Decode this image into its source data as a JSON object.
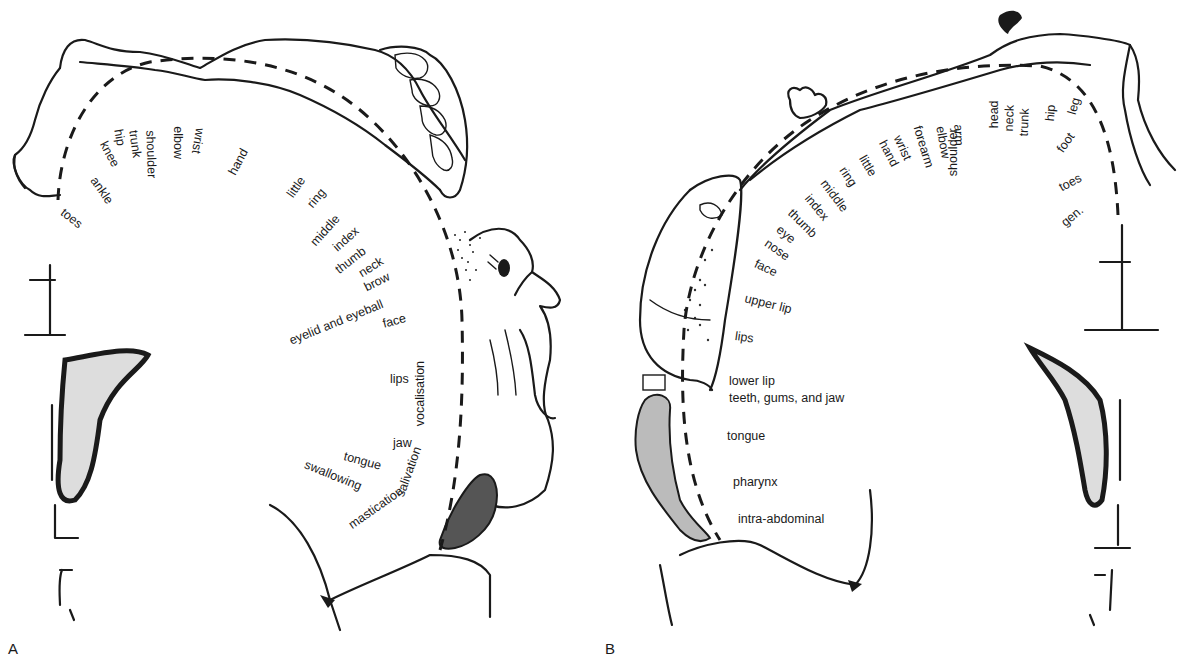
{
  "figure": {
    "panel_a_letter": "A",
    "panel_b_letter": "B"
  },
  "panel_a": {
    "title": "Motor homunculus",
    "labels": [
      {
        "text": "toes",
        "x": 62,
        "y": 205,
        "rot": 38
      },
      {
        "text": "ankle",
        "x": 93,
        "y": 172,
        "rot": 55
      },
      {
        "text": "knee",
        "x": 103,
        "y": 136,
        "rot": 62
      },
      {
        "text": "hip",
        "x": 118,
        "y": 123,
        "rot": 80
      },
      {
        "text": "trunk",
        "x": 133,
        "y": 124,
        "rot": 82
      },
      {
        "text": "shoulder",
        "x": 150,
        "y": 124,
        "rot": 88
      },
      {
        "text": "elbow",
        "x": 178,
        "y": 120,
        "rot": 90
      },
      {
        "text": "wrist",
        "x": 200,
        "y": 122,
        "rot": 100
      },
      {
        "text": "hand",
        "x": 232,
        "y": 168,
        "rot": -62
      },
      {
        "text": "little",
        "x": 290,
        "y": 190,
        "rot": -55
      },
      {
        "text": "ring",
        "x": 310,
        "y": 200,
        "rot": -50
      },
      {
        "text": "middle",
        "x": 313,
        "y": 238,
        "rot": -48
      },
      {
        "text": "index",
        "x": 335,
        "y": 243,
        "rot": -42
      },
      {
        "text": "thumb",
        "x": 337,
        "y": 265,
        "rot": -38
      },
      {
        "text": "neck",
        "x": 360,
        "y": 268,
        "rot": -32
      },
      {
        "text": "brow",
        "x": 365,
        "y": 282,
        "rot": -27
      },
      {
        "text": "eyelid and eyeball",
        "x": 290,
        "y": 335,
        "rot": -22
      },
      {
        "text": "face",
        "x": 383,
        "y": 318,
        "rot": -15
      },
      {
        "text": "lips",
        "x": 390,
        "y": 373,
        "rot": 0
      },
      {
        "text": "jaw",
        "x": 393,
        "y": 437,
        "rot": 0
      },
      {
        "text": "tongue",
        "x": 344,
        "y": 450,
        "rot": 15
      },
      {
        "text": "swallowing",
        "x": 305,
        "y": 458,
        "rot": 22
      }
    ],
    "functions": [
      {
        "text": "vocalisation",
        "x": 420,
        "y": 420,
        "rot": -90
      },
      {
        "text": "salivation",
        "x": 400,
        "y": 490,
        "rot": -70
      },
      {
        "text": "mastication",
        "x": 350,
        "y": 520,
        "rot": -35
      }
    ]
  },
  "panel_b": {
    "title": "Sensory homunculus",
    "labels": [
      {
        "text": "gen.",
        "x": 1063,
        "y": 218,
        "rot": -40
      },
      {
        "text": "toes",
        "x": 1060,
        "y": 182,
        "rot": -28
      },
      {
        "text": "foot",
        "x": 1060,
        "y": 145,
        "rot": -55
      },
      {
        "text": "leg",
        "x": 1072,
        "y": 108,
        "rot": -75
      },
      {
        "text": "hip",
        "x": 1050,
        "y": 115,
        "rot": -85
      },
      {
        "text": "trunk",
        "x": 1024,
        "y": 130,
        "rot": -88
      },
      {
        "text": "neck",
        "x": 1009,
        "y": 125,
        "rot": -88
      },
      {
        "text": "head",
        "x": 994,
        "y": 122,
        "rot": -90
      },
      {
        "text": "shoulder",
        "x": 953,
        "y": 170,
        "rot": -90
      },
      {
        "text": "arm",
        "x": 958,
        "y": 118,
        "rot": 88
      },
      {
        "text": "elbow",
        "x": 940,
        "y": 120,
        "rot": 80
      },
      {
        "text": "forearm",
        "x": 917,
        "y": 120,
        "rot": 73
      },
      {
        "text": "wrist",
        "x": 897,
        "y": 130,
        "rot": 65
      },
      {
        "text": "hand",
        "x": 882,
        "y": 135,
        "rot": 62
      },
      {
        "text": "little",
        "x": 862,
        "y": 150,
        "rot": 60
      },
      {
        "text": "ring",
        "x": 842,
        "y": 162,
        "rot": 56
      },
      {
        "text": "middle",
        "x": 823,
        "y": 175,
        "rot": 53
      },
      {
        "text": "index",
        "x": 807,
        "y": 190,
        "rot": 50
      },
      {
        "text": "thumb",
        "x": 790,
        "y": 205,
        "rot": 45
      },
      {
        "text": "eye",
        "x": 778,
        "y": 222,
        "rot": 40
      },
      {
        "text": "nose",
        "x": 766,
        "y": 236,
        "rot": 35
      },
      {
        "text": "face",
        "x": 755,
        "y": 257,
        "rot": 25
      },
      {
        "text": "upper lip",
        "x": 745,
        "y": 292,
        "rot": 14
      },
      {
        "text": "lips",
        "x": 735,
        "y": 330,
        "rot": 8
      },
      {
        "text": "lower lip",
        "x": 729,
        "y": 375,
        "rot": 0
      },
      {
        "text": "teeth, gums, and jaw",
        "x": 729,
        "y": 392,
        "rot": 0
      },
      {
        "text": "tongue",
        "x": 727,
        "y": 430,
        "rot": 0
      },
      {
        "text": "pharynx",
        "x": 733,
        "y": 476,
        "rot": 0
      },
      {
        "text": "intra-abdominal",
        "x": 738,
        "y": 513,
        "rot": 0
      }
    ]
  }
}
